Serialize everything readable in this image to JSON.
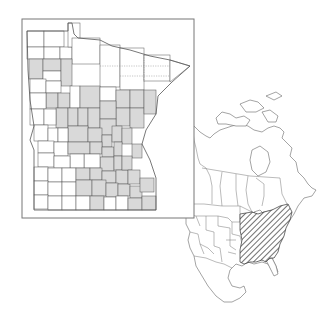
{
  "figure": {
    "type": "species-distribution-map",
    "title": "",
    "panels": [
      {
        "id": "minnesota-county-map",
        "region": "Minnesota",
        "description": "County-level occurrence map; counties with records are shaded gray",
        "shade_color": "#d9d9d9",
        "outline_color": "#555555",
        "frame_color": "#777777"
      },
      {
        "id": "north-america-range-map",
        "region": "North America",
        "description": "Overall range shown with diagonal hatching over eastern United States",
        "hatch_color": "#333333",
        "outline_color": "#666666"
      }
    ]
  }
}
